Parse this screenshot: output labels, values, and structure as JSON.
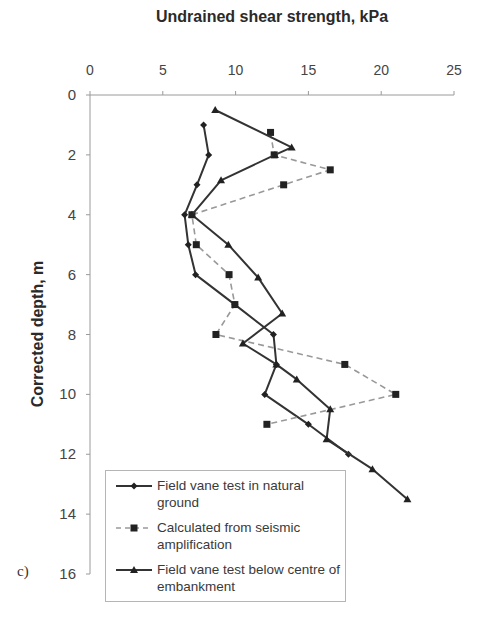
{
  "chart_data": {
    "type": "line",
    "title": "",
    "xlabel": "Undrained shear strength, kPa",
    "ylabel": "Corrected depth, m",
    "panel_label": "c)",
    "xlim": [
      0,
      25
    ],
    "ylim": [
      0,
      16
    ],
    "y_inverted": true,
    "x_axis_position": "top",
    "x_ticks": [
      0,
      5,
      10,
      15,
      20,
      25
    ],
    "y_ticks": [
      0,
      2,
      4,
      6,
      8,
      10,
      12,
      14,
      16
    ],
    "grid": false,
    "legend_position": "lower-left inside",
    "series": [
      {
        "name": "Field vane test in natural ground",
        "line_style": "solid",
        "marker": "diamond",
        "color": "#333333",
        "points": [
          {
            "x": 7.8,
            "y": 1.0
          },
          {
            "x": 8.15,
            "y": 2.0
          },
          {
            "x": 7.35,
            "y": 3.0
          },
          {
            "x": 6.5,
            "y": 4.0
          },
          {
            "x": 6.75,
            "y": 5.0
          },
          {
            "x": 7.25,
            "y": 6.0
          },
          {
            "x": 9.95,
            "y": 7.0
          },
          {
            "x": 12.6,
            "y": 8.0
          },
          {
            "x": 12.8,
            "y": 9.0
          },
          {
            "x": 12.0,
            "y": 10.0
          },
          {
            "x": 15.0,
            "y": 11.0
          },
          {
            "x": 17.75,
            "y": 12.0
          }
        ]
      },
      {
        "name": "Calculated from seismic amplification",
        "line_style": "dashed",
        "marker": "square",
        "color": "#999999",
        "marker_color": "#222222",
        "points": [
          {
            "x": 12.4,
            "y": 1.25
          },
          {
            "x": 12.65,
            "y": 2.0
          },
          {
            "x": 16.5,
            "y": 2.5
          },
          {
            "x": 13.3,
            "y": 3.0
          },
          {
            "x": 7.0,
            "y": 4.0
          },
          {
            "x": 7.3,
            "y": 5.0
          },
          {
            "x": 9.55,
            "y": 6.0
          },
          {
            "x": 9.95,
            "y": 7.0
          },
          {
            "x": 8.65,
            "y": 8.0
          },
          {
            "x": 17.5,
            "y": 9.0
          },
          {
            "x": 21.0,
            "y": 10.0
          },
          {
            "x": 12.15,
            "y": 11.0
          }
        ]
      },
      {
        "name": "Field vane test below centre of embankment",
        "line_style": "solid",
        "marker": "triangle",
        "color": "#333333",
        "points": [
          {
            "x": 8.6,
            "y": 0.5
          },
          {
            "x": 13.85,
            "y": 1.75
          },
          {
            "x": 12.7,
            "y": 2.0
          },
          {
            "x": 9.0,
            "y": 2.85
          },
          {
            "x": 7.0,
            "y": 4.0
          },
          {
            "x": 9.5,
            "y": 5.0
          },
          {
            "x": 11.55,
            "y": 6.1
          },
          {
            "x": 13.2,
            "y": 7.3
          },
          {
            "x": 10.5,
            "y": 8.3
          },
          {
            "x": 12.8,
            "y": 9.0
          },
          {
            "x": 14.2,
            "y": 9.5
          },
          {
            "x": 16.5,
            "y": 10.5
          },
          {
            "x": 16.25,
            "y": 11.5
          },
          {
            "x": 19.4,
            "y": 12.5
          },
          {
            "x": 21.8,
            "y": 13.5
          }
        ]
      }
    ]
  },
  "legend": {
    "items": [
      {
        "label": "Field vane test in natural ground"
      },
      {
        "label": "Calculated from seismic amplification"
      },
      {
        "label": "Field vane test below centre of embankment"
      }
    ]
  },
  "colors": {
    "axis": "#9a9a9a",
    "series_dark": "#333333",
    "series_dashed": "#999999"
  }
}
